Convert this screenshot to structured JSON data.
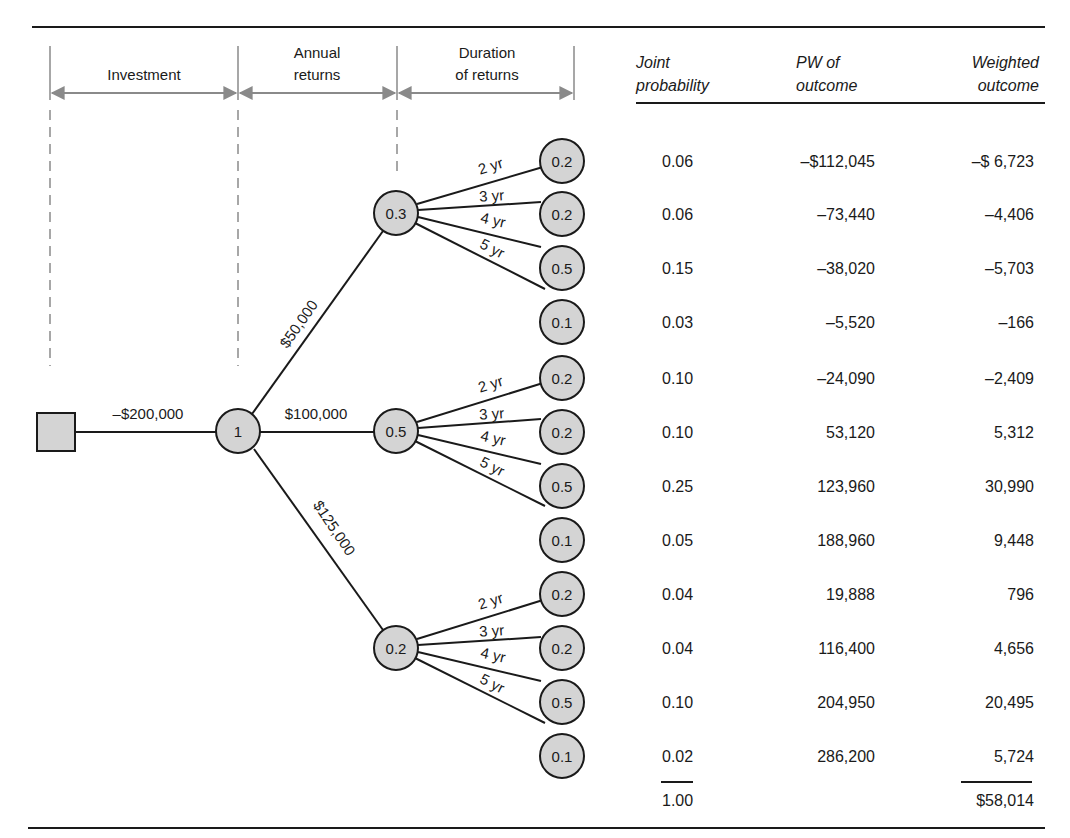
{
  "figure": {
    "colors": {
      "node_fill": "#d4d4d4",
      "stroke": "#1a1a1a",
      "guide": "#8a8a8a"
    },
    "stage_headers": [
      {
        "lines": [
          "Investment"
        ]
      },
      {
        "lines": [
          "Annual",
          "returns"
        ]
      },
      {
        "lines": [
          "Duration",
          "of returns"
        ]
      }
    ],
    "tree": {
      "decision_node": {
        "shape": "square"
      },
      "investment_label": "–$200,000",
      "root_chance": {
        "label": "1"
      },
      "branches": [
        {
          "label": "$50,000",
          "probability": "0.3",
          "durations": [
            {
              "label": "2 yr",
              "probability": "0.2"
            },
            {
              "label": "3 yr",
              "probability": "0.2"
            },
            {
              "label": "4 yr",
              "probability": "0.5"
            },
            {
              "label": "5 yr",
              "probability": "0.1"
            }
          ]
        },
        {
          "label": "$100,000",
          "probability": "0.5",
          "durations": [
            {
              "label": "2 yr",
              "probability": "0.2"
            },
            {
              "label": "3 yr",
              "probability": "0.2"
            },
            {
              "label": "4 yr",
              "probability": "0.5"
            },
            {
              "label": "5 yr",
              "probability": "0.1"
            }
          ]
        },
        {
          "label": "$125,000",
          "probability": "0.2",
          "durations": [
            {
              "label": "2 yr",
              "probability": "0.2"
            },
            {
              "label": "3 yr",
              "probability": "0.2"
            },
            {
              "label": "4 yr",
              "probability": "0.5"
            },
            {
              "label": "5 yr",
              "probability": "0.1"
            }
          ]
        }
      ]
    },
    "table": {
      "headers": [
        {
          "lines": [
            "Joint",
            "probability"
          ]
        },
        {
          "lines": [
            "PW of",
            "outcome"
          ]
        },
        {
          "lines": [
            "Weighted",
            "outcome"
          ]
        }
      ],
      "rows": [
        {
          "joint": "0.06",
          "pw": "–$112,045",
          "weighted": "–$ 6,723"
        },
        {
          "joint": "0.06",
          "pw": "–73,440",
          "weighted": "–4,406"
        },
        {
          "joint": "0.15",
          "pw": "–38,020",
          "weighted": "–5,703"
        },
        {
          "joint": "0.03",
          "pw": "–5,520",
          "weighted": "–166"
        },
        {
          "joint": "0.10",
          "pw": "–24,090",
          "weighted": "–2,409"
        },
        {
          "joint": "0.10",
          "pw": "53,120",
          "weighted": "5,312"
        },
        {
          "joint": "0.25",
          "pw": "123,960",
          "weighted": "30,990"
        },
        {
          "joint": "0.05",
          "pw": "188,960",
          "weighted": "9,448"
        },
        {
          "joint": "0.04",
          "pw": "19,888",
          "weighted": "796"
        },
        {
          "joint": "0.04",
          "pw": "116,400",
          "weighted": "4,656"
        },
        {
          "joint": "0.10",
          "pw": "204,950",
          "weighted": "20,495"
        },
        {
          "joint": "0.02",
          "pw": "286,200",
          "weighted": "5,724"
        }
      ],
      "totals": {
        "joint": "1.00",
        "weighted": "$58,014"
      }
    }
  }
}
